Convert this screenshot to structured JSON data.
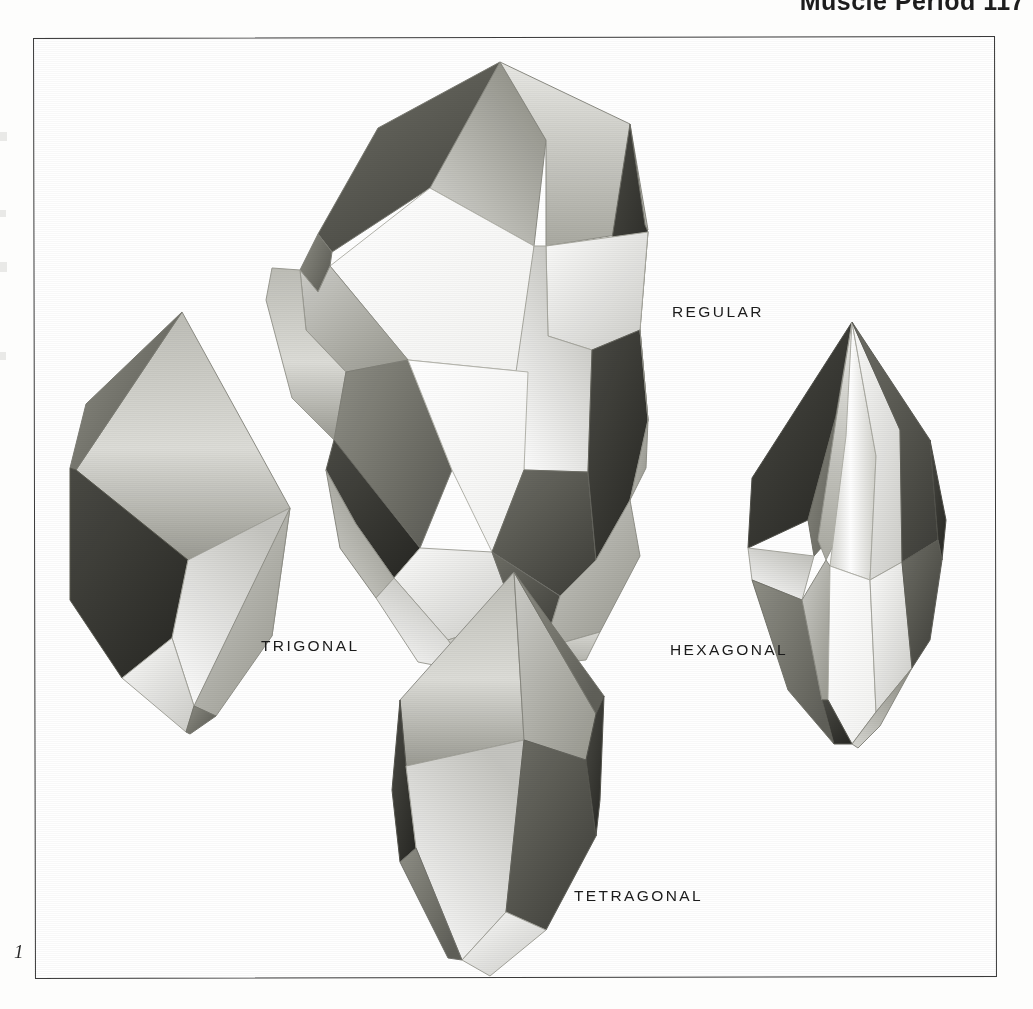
{
  "page": {
    "running_head": "Muscle Period  117",
    "figure_number": "1",
    "background_color": "#ffffff",
    "frame_color": "#3a3a3a",
    "ink_color": "#1b1b1b"
  },
  "figure": {
    "caption_labels": [
      {
        "id": "regular",
        "label": "REGULAR"
      },
      {
        "id": "trigonal",
        "label": "TRIGONAL"
      },
      {
        "id": "hexagonal",
        "label": "HEXAGONAL"
      },
      {
        "id": "tetragonal",
        "label": "TETRAGONAL"
      }
    ],
    "shapes": [
      {
        "id": "regular",
        "name": "regular-polyhedron-dodecahedron"
      },
      {
        "id": "trigonal",
        "name": "trigonal-bipyramid-crystal"
      },
      {
        "id": "hexagonal",
        "name": "hexagonal-bipyramid-crystal"
      },
      {
        "id": "tetragonal",
        "name": "tetragonal-bipyramid-crystal"
      }
    ]
  }
}
